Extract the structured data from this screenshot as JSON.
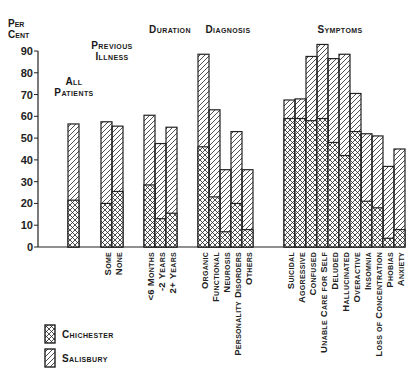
{
  "chart_data": {
    "type": "bar",
    "stacked": false,
    "overlay": true,
    "title": "",
    "ylabel": "Per Cent",
    "xlabel": "",
    "ylim": [
      0,
      90
    ],
    "yticks": [
      0,
      10,
      20,
      30,
      40,
      50,
      60,
      70,
      80,
      90
    ],
    "grid": false,
    "legend_position": "bottom-left",
    "groups": [
      {
        "label": "All Patients",
        "categories": [
          ""
        ],
        "salisbury": [
          56.5
        ],
        "chichester": [
          21.5
        ]
      },
      {
        "label": "Previous Illness",
        "categories": [
          "Some",
          "None"
        ],
        "salisbury": [
          57.5,
          55.5
        ],
        "chichester": [
          20,
          25.5
        ]
      },
      {
        "label": "Duration",
        "categories": [
          "<6 Months",
          "-2 Years",
          "2+ Years"
        ],
        "salisbury": [
          60.5,
          47.5,
          55
        ],
        "chichester": [
          28.5,
          13,
          15.5
        ]
      },
      {
        "label": "Diagnosis",
        "categories": [
          "Organic",
          "Functional",
          "Neurosis",
          "Personality Disorders",
          "Others"
        ],
        "salisbury": [
          88.5,
          63,
          35.5,
          53,
          35.5
        ],
        "chichester": [
          46,
          23,
          7,
          20,
          8
        ]
      },
      {
        "label": "Symptoms",
        "categories": [
          "Suicidal",
          "Aggressive",
          "Confused",
          "Unable Care for Self",
          "Deluded",
          "Hallucinated",
          "Overactive",
          "Insomnia",
          "Loss of Concentration",
          "Phobias",
          "Anxiety"
        ],
        "salisbury": [
          67.5,
          68,
          87.5,
          93,
          86.5,
          88.5,
          70.5,
          52,
          51,
          37,
          45
        ],
        "chichester": [
          59,
          59,
          58,
          59,
          48,
          42,
          53,
          21,
          18,
          4,
          8
        ]
      }
    ],
    "series": [
      {
        "name": "Chichester",
        "pattern": "cross-hatch"
      },
      {
        "name": "Salisbury",
        "pattern": "diagonal-hatch"
      }
    ]
  },
  "axis": {
    "ylabel_line1": "Per",
    "ylabel_line2": "Cent"
  },
  "group_titles": {
    "all": [
      "All",
      "Patients"
    ],
    "previous": [
      "Previous",
      "Illness"
    ],
    "duration": "Duration",
    "diagnosis": "Diagnosis",
    "symptoms": "Symptoms"
  },
  "legend": {
    "chichester": "Chichester",
    "salisbury": "Salisbury"
  },
  "colors": {
    "ink": "#1a1a1a",
    "background": "#ffffff"
  }
}
